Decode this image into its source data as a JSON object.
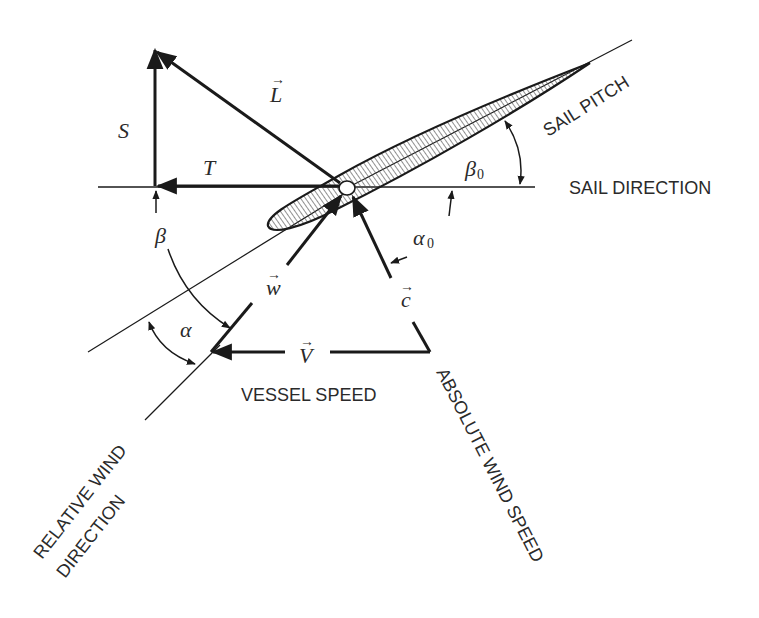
{
  "diagram": {
    "colors": {
      "background": "#ffffff",
      "stroke": "#1a1a1a",
      "text": "#2a2a2a",
      "hatch": "#555555"
    },
    "labels": {
      "sail_pitch": "SAIL PITCH",
      "sail_direction": "SAIL DIRECTION",
      "vessel_speed": "VESSEL SPEED",
      "absolute_wind_speed": "ABSOLUTE WIND SPEED",
      "relative_wind_line1": "RELATIVE WIND",
      "relative_wind_line2": "DIRECTION"
    },
    "symbols": {
      "lift": "L",
      "side_force": "S",
      "thrust": "T",
      "relative_wind": "w",
      "absolute_wind": "c",
      "vessel_velocity": "V",
      "beta": "β",
      "beta0_base": "β",
      "beta0_sub": "0",
      "alpha": "α",
      "alpha0_base": "α",
      "alpha0_sub": "0",
      "vector_arrow": "⃗"
    }
  }
}
